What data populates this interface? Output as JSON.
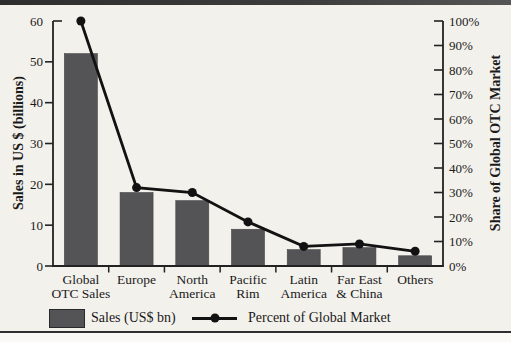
{
  "chart_data": {
    "type": "bar",
    "title": "",
    "categories": [
      "Global OTC Sales",
      "Europe",
      "North America",
      "Pacific Rim",
      "Latin America",
      "Far East & China",
      "Others"
    ],
    "category_lines": [
      [
        "Global",
        "OTC Sales"
      ],
      [
        "Europe"
      ],
      [
        "North",
        "America"
      ],
      [
        "Pacific",
        "Rim"
      ],
      [
        "Latin",
        "America"
      ],
      [
        "Far East",
        "& China"
      ],
      [
        "Others"
      ]
    ],
    "series": [
      {
        "name": "Sales (US$ bn)",
        "type": "bar",
        "axis": "left",
        "values": [
          52,
          18,
          16,
          9,
          4,
          4.5,
          2.5
        ]
      },
      {
        "name": "Percent of Global Market",
        "type": "line",
        "axis": "right",
        "values": [
          100,
          32,
          30,
          18,
          8,
          9,
          6
        ]
      }
    ],
    "left_axis": {
      "label": "Sales in US $ (billions)",
      "min": 0,
      "max": 60,
      "step": 10,
      "tick_labels": [
        "0",
        "10",
        "20",
        "30",
        "40",
        "50",
        "60"
      ]
    },
    "right_axis": {
      "label": "Share of Global OTC Market",
      "min": 0,
      "max": 100,
      "step": 10,
      "tick_labels": [
        "0%",
        "10%",
        "20%",
        "30%",
        "40%",
        "50%",
        "60%",
        "70%",
        "80%",
        "90%",
        "100%"
      ]
    },
    "legend": [
      {
        "label": "Sales (US$ bn)",
        "marker": "bar-swatch"
      },
      {
        "label": "Percent of Global Market",
        "marker": "line-dot"
      }
    ],
    "grid": false,
    "legend_position": "bottom",
    "colors": {
      "bar": "#545456",
      "line": "#121212",
      "axis": "#222222",
      "text": "#1a1a1a"
    }
  }
}
